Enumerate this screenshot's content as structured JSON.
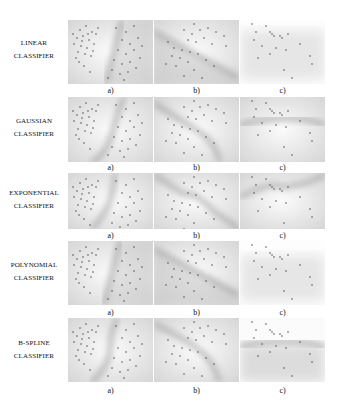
{
  "figure": {
    "rows": [
      {
        "label_line1": "LINEAR",
        "label_line2": "CLASSIFIER",
        "top": 20,
        "height": 64,
        "sub_top": 88
      },
      {
        "label_line1": "GAUSSIAN",
        "label_line2": "CLASSIFIER",
        "top": 97,
        "height": 65,
        "sub_top": 164
      },
      {
        "label_line1": "EXPONENTIAL",
        "label_line2": "CLASSIFIER",
        "top": 173,
        "height": 56,
        "sub_top": 231
      },
      {
        "label_line1": "POLYNOMIAL",
        "label_line2": "CLASSIFIER",
        "top": 241,
        "height": 64,
        "sub_top": 308
      },
      {
        "label_line1": "B-SPLINE",
        "label_line2": "CLASSIFIER",
        "top": 318,
        "height": 64,
        "sub_top": 386
      }
    ],
    "columns": [
      {
        "sub_label": "a)",
        "left": 68
      },
      {
        "sub_label": "b)",
        "left": 154
      },
      {
        "sub_label": "c)",
        "left": 240
      }
    ],
    "colors": {
      "background": "#ffffff",
      "panel": "#f2f2f2",
      "boundary": "#9a9a9a",
      "points": "#333333"
    }
  }
}
